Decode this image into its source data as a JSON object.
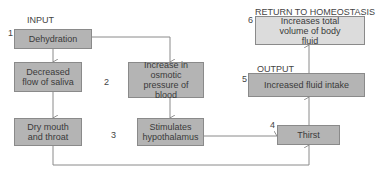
{
  "labels": {
    "input": "INPUT",
    "output": "OUTPUT",
    "return": "RETURN TO HOMEOSTASIS"
  },
  "steps": {
    "dehydration": {
      "num": "1",
      "text": "Dehydration"
    },
    "saliva": {
      "text": "Decreased flow of saliva"
    },
    "osmotic": {
      "num": "2",
      "text": "Increase in osmotic pressure of blood"
    },
    "dry_mouth": {
      "text": "Dry mouth and throat"
    },
    "hypothalamus": {
      "num": "3",
      "text": "Stimulates hypothalamus"
    },
    "thirst": {
      "num": "4",
      "text": "Thirst"
    },
    "intake": {
      "num": "5",
      "text": "Increased fluid intake"
    },
    "volume": {
      "num": "6",
      "text": "Increases total volume of body fluid"
    }
  },
  "colors": {
    "dark_box": "#b4b4b4",
    "light_box": "#dcdcdc",
    "line": "#8a8a8a"
  }
}
